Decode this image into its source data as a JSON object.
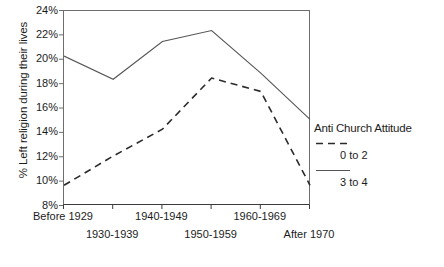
{
  "chart_data": {
    "type": "line",
    "title": "",
    "xlabel": "",
    "ylabel": "% Left religion during their lives",
    "categories": [
      "Before 1929",
      "1930-1939",
      "1940-1949",
      "1950-1959",
      "1960-1969",
      "After 1970"
    ],
    "ylim": [
      8,
      24
    ],
    "ytick_labels": [
      "8%",
      "10%",
      "12%",
      "14%",
      "16%",
      "18%",
      "20%",
      "22%",
      "24%"
    ],
    "ytick_values": [
      8,
      10,
      12,
      14,
      16,
      18,
      20,
      22,
      24
    ],
    "grid": false,
    "legend_position": "right",
    "legend_title": "Anti Church Attitude",
    "series": [
      {
        "name": "0 to 2",
        "style": "dashed",
        "color": "#2b2b2b",
        "values": [
          9.7,
          12.1,
          14.3,
          18.5,
          17.4,
          9.7
        ]
      },
      {
        "name": "3 to 4",
        "style": "solid",
        "color": "#555555",
        "values": [
          20.3,
          18.4,
          21.5,
          22.4,
          18.9,
          15.1
        ]
      }
    ]
  },
  "axis": {
    "y_title": "% Left religion during their lives"
  },
  "legend": {
    "title": "Anti Church Attitude",
    "entries": [
      {
        "label": "0 to 2",
        "style": "dashed"
      },
      {
        "label": "3 to 4",
        "style": "solid"
      }
    ]
  }
}
